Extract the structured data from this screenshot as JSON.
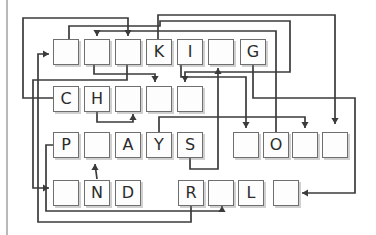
{
  "figure": {
    "canvas": {
      "width": 376,
      "height": 235
    },
    "colors": {
      "background": "#ffffff",
      "line": "#3b3b3b",
      "tile_border": "#6f6f6f",
      "tile_fill": "#fdfdfd",
      "letter": "#2b2b2b",
      "page_edge": "#b9b9b9"
    },
    "tile_size": 26,
    "rows": [
      {
        "name": "row-1",
        "top": 39,
        "groups": [
          {
            "xs": [
              53,
              84,
              115,
              146,
              177,
              208,
              240
            ],
            "letters": [
              "",
              "",
              "",
              "K",
              "I",
              "",
              "G"
            ]
          }
        ]
      },
      {
        "name": "row-2",
        "top": 86,
        "groups": [
          {
            "xs": [
              53,
              84,
              115,
              146,
              177
            ],
            "letters": [
              "C",
              "H",
              "",
              "",
              ""
            ]
          }
        ]
      },
      {
        "name": "row-3",
        "top": 132,
        "groups": [
          {
            "xs": [
              53,
              84,
              115,
              146,
              177
            ],
            "letters": [
              "P",
              "",
              "A",
              "Y",
              "S"
            ]
          },
          {
            "xs": [
              233,
              263,
              292,
              322
            ],
            "letters": [
              "",
              "O",
              "",
              ""
            ]
          }
        ]
      },
      {
        "name": "row-4",
        "top": 180,
        "groups": [
          {
            "xs": [
              53,
              84,
              115
            ],
            "letters": [
              "",
              "N",
              "D"
            ]
          },
          {
            "xs": [
              178,
              208,
              238
            ],
            "letters": [
              "R",
              "",
              "L"
            ]
          },
          {
            "xs": [
              273
            ],
            "letters": [
              ""
            ]
          }
        ]
      }
    ],
    "visible_words": [
      "___KI_G",
      "CH___",
      "P_AYS",
      "_O__",
      "_ND",
      "R_L",
      "_"
    ],
    "arrows": [
      {
        "points": [
          [
            53,
            98
          ],
          [
            23,
            98
          ],
          [
            23,
            18
          ],
          [
            128,
            18
          ],
          [
            128,
            36
          ]
        ],
        "head": "down"
      },
      {
        "points": [
          [
            276,
            132
          ],
          [
            276,
            31
          ],
          [
            97,
            31
          ],
          [
            97,
            36
          ]
        ],
        "head": "down"
      },
      {
        "points": [
          [
            158,
            39
          ],
          [
            158,
            15
          ],
          [
            335,
            15
          ],
          [
            335,
            124
          ]
        ],
        "head": "down"
      },
      {
        "points": [
          [
            69,
            39
          ],
          [
            69,
            26
          ],
          [
            160,
            26
          ],
          [
            160,
            21
          ],
          [
            290,
            21
          ],
          [
            290,
            72
          ],
          [
            185,
            72
          ],
          [
            185,
            82
          ]
        ],
        "head": "down"
      },
      {
        "points": [
          [
            94,
            65
          ],
          [
            94,
            74
          ],
          [
            155,
            74
          ],
          [
            155,
            82
          ]
        ],
        "head": "down"
      },
      {
        "points": [
          [
            127,
            65
          ],
          [
            127,
            80
          ],
          [
            33,
            80
          ],
          [
            33,
            188
          ],
          [
            49,
            188
          ]
        ],
        "head": "right"
      },
      {
        "points": [
          [
            253,
            65
          ],
          [
            253,
            98
          ],
          [
            355,
            98
          ],
          [
            355,
            193
          ],
          [
            302,
            193
          ]
        ],
        "head": "left"
      },
      {
        "points": [
          [
            191,
            205
          ],
          [
            191,
            222
          ],
          [
            38,
            222
          ],
          [
            38,
            54
          ],
          [
            49,
            54
          ]
        ],
        "head": "right"
      },
      {
        "points": [
          [
            97,
            179
          ],
          [
            95,
            164
          ]
        ],
        "head": "up"
      },
      {
        "points": [
          [
            97,
            111
          ],
          [
            97,
            122
          ],
          [
            133,
            122
          ],
          [
            133,
            114
          ]
        ],
        "head": "up"
      },
      {
        "points": [
          [
            181,
            65
          ],
          [
            181,
            77
          ],
          [
            246,
            77
          ],
          [
            246,
            128
          ]
        ],
        "head": "down"
      },
      {
        "points": [
          [
            190,
            157
          ],
          [
            190,
            169
          ],
          [
            218,
            169
          ],
          [
            218,
            68
          ]
        ],
        "head": "up"
      },
      {
        "points": [
          [
            53,
            145
          ],
          [
            46,
            145
          ],
          [
            46,
            211
          ],
          [
            222,
            211
          ],
          [
            222,
            206
          ]
        ],
        "head": "up"
      },
      {
        "points": [
          [
            159,
            132
          ],
          [
            159,
            117
          ],
          [
            305,
            117
          ],
          [
            305,
            128
          ]
        ],
        "head": "down"
      }
    ]
  }
}
